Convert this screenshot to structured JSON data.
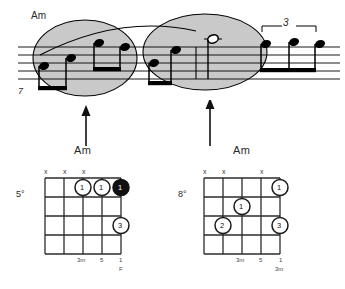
{
  "notation": {
    "chord_label": "Am",
    "measure_number": "7",
    "tuplet_label": "3",
    "staff_lines": 5,
    "ellipse_1_label": "phrase-group-1",
    "ellipse_2_label": "phrase-group-2",
    "notes": [
      {
        "id": "n1",
        "type": "eighth",
        "staff_pos": "low",
        "beam_group": 1
      },
      {
        "id": "n2",
        "type": "eighth",
        "staff_pos": "mid",
        "beam_group": 1
      },
      {
        "id": "n3",
        "type": "eighth",
        "staff_pos": "high",
        "beam_group": 2
      },
      {
        "id": "n4",
        "type": "eighth",
        "staff_pos": "high",
        "beam_group": 2
      },
      {
        "id": "n5",
        "type": "eighth",
        "staff_pos": "mid",
        "beam_group": 3
      },
      {
        "id": "n6",
        "type": "eighth",
        "staff_pos": "high",
        "beam_group": 3
      },
      {
        "id": "n7",
        "type": "half",
        "staff_pos": "ledger-above",
        "beam_group": 0
      },
      {
        "id": "n8",
        "type": "eighth",
        "staff_pos": "high",
        "beam_group": 4
      },
      {
        "id": "n9",
        "type": "eighth",
        "staff_pos": "high",
        "beam_group": 4
      },
      {
        "id": "n10",
        "type": "eighth",
        "staff_pos": "high",
        "beam_group": 4
      }
    ]
  },
  "arrows": {
    "left_arrow_name": "arrow-to-group-1",
    "right_arrow_name": "arrow-to-group-2"
  },
  "chord_left": {
    "title": "Am",
    "position": "5°",
    "mutes": [
      "x",
      "x",
      "x"
    ],
    "frets": 5,
    "strings": 6,
    "dots": [
      {
        "label": "1",
        "filled": false
      },
      {
        "label": "1",
        "filled": false
      },
      {
        "label": "1",
        "filled": true
      },
      {
        "label": "3",
        "filled": false
      }
    ],
    "intervals": [
      "3m",
      "5",
      "1"
    ],
    "root_marker": "F"
  },
  "chord_right": {
    "title": "Am",
    "position": "8°",
    "mutes": [
      "x",
      "x",
      "x"
    ],
    "frets": 5,
    "strings": 6,
    "dots": [
      {
        "label": "1",
        "filled": false
      },
      {
        "label": "1",
        "filled": false
      },
      {
        "label": "2",
        "filled": false
      },
      {
        "label": "3",
        "filled": false
      }
    ],
    "intervals": [
      "3m",
      "5",
      "1"
    ],
    "root_marker": "3m"
  },
  "colors": {
    "ink": "#1a1a1a",
    "ellipse_fill": "#c9c9c9",
    "ellipse_stroke": "#000000",
    "staff": "#000000",
    "grid": "#2b2b2b"
  }
}
